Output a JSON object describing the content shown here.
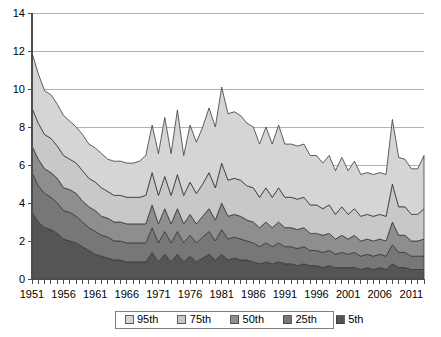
{
  "chart_data": {
    "type": "area",
    "stacked": true,
    "title": "",
    "xlabel": "",
    "ylabel": "",
    "ylim": [
      0,
      14
    ],
    "yticks": [
      0,
      2,
      4,
      6,
      8,
      10,
      12,
      14
    ],
    "grid": true,
    "legend_position": "bottom",
    "x_tick_labels": [
      "1951",
      "1956",
      "1961",
      "1966",
      "1971",
      "1976",
      "1981",
      "1986",
      "1991",
      "1996",
      "2001",
      "2006",
      "2011"
    ],
    "x": [
      1951,
      1952,
      1953,
      1954,
      1955,
      1956,
      1957,
      1958,
      1959,
      1960,
      1961,
      1962,
      1963,
      1964,
      1965,
      1966,
      1967,
      1968,
      1969,
      1970,
      1971,
      1972,
      1973,
      1974,
      1975,
      1976,
      1977,
      1978,
      1979,
      1980,
      1981,
      1982,
      1983,
      1984,
      1985,
      1986,
      1987,
      1988,
      1989,
      1990,
      1991,
      1992,
      1993,
      1994,
      1995,
      1996,
      1997,
      1998,
      1999,
      2000,
      2001,
      2002,
      2003,
      2004,
      2005,
      2006,
      2007,
      2008,
      2009,
      2010,
      2011,
      2012,
      2013
    ],
    "series": [
      {
        "name": "5th",
        "color": "#555555",
        "values": [
          3.5,
          3.0,
          2.7,
          2.6,
          2.4,
          2.1,
          2.0,
          1.9,
          1.7,
          1.5,
          1.3,
          1.2,
          1.1,
          1.0,
          1.0,
          0.9,
          0.9,
          0.9,
          0.9,
          1.4,
          0.9,
          1.3,
          0.9,
          1.3,
          0.9,
          1.2,
          0.9,
          1.1,
          1.3,
          1.0,
          1.3,
          1.0,
          1.1,
          1.0,
          1.0,
          0.9,
          0.8,
          0.9,
          0.8,
          0.9,
          0.8,
          0.8,
          0.7,
          0.8,
          0.7,
          0.7,
          0.6,
          0.7,
          0.6,
          0.6,
          0.6,
          0.6,
          0.5,
          0.6,
          0.5,
          0.6,
          0.5,
          0.8,
          0.6,
          0.6,
          0.5,
          0.5,
          0.5
        ]
      },
      {
        "name": "25th",
        "color": "#777777",
        "values": [
          2.1,
          1.9,
          1.8,
          1.7,
          1.6,
          1.5,
          1.5,
          1.4,
          1.3,
          1.2,
          1.2,
          1.1,
          1.1,
          1.0,
          1.0,
          1.0,
          1.0,
          1.0,
          1.0,
          1.3,
          1.0,
          1.2,
          1.0,
          1.2,
          1.0,
          1.1,
          1.0,
          1.1,
          1.2,
          1.0,
          1.3,
          1.1,
          1.1,
          1.1,
          1.0,
          1.0,
          0.9,
          1.0,
          0.9,
          1.0,
          0.9,
          0.9,
          0.9,
          0.9,
          0.8,
          0.8,
          0.8,
          0.8,
          0.7,
          0.8,
          0.7,
          0.8,
          0.7,
          0.7,
          0.7,
          0.7,
          0.7,
          1.0,
          0.8,
          0.8,
          0.7,
          0.7,
          0.7
        ]
      },
      {
        "name": "50th",
        "color": "#8e8e8e",
        "values": [
          1.4,
          1.4,
          1.3,
          1.3,
          1.3,
          1.2,
          1.2,
          1.2,
          1.1,
          1.1,
          1.1,
          1.0,
          1.0,
          1.0,
          1.0,
          1.0,
          1.0,
          1.0,
          1.0,
          1.2,
          1.0,
          1.2,
          1.0,
          1.2,
          1.0,
          1.1,
          1.0,
          1.1,
          1.2,
          1.1,
          1.4,
          1.2,
          1.2,
          1.2,
          1.1,
          1.1,
          1.0,
          1.1,
          1.0,
          1.1,
          1.0,
          1.0,
          1.0,
          1.0,
          0.9,
          0.9,
          0.9,
          0.9,
          0.8,
          0.9,
          0.8,
          0.9,
          0.8,
          0.8,
          0.8,
          0.8,
          0.8,
          1.2,
          0.9,
          0.9,
          0.8,
          0.8,
          0.9
        ]
      },
      {
        "name": "75th",
        "color": "#c8c8c8",
        "values": [
          2.0,
          1.9,
          1.8,
          1.8,
          1.7,
          1.7,
          1.6,
          1.6,
          1.6,
          1.5,
          1.5,
          1.5,
          1.4,
          1.4,
          1.4,
          1.4,
          1.4,
          1.4,
          1.5,
          1.7,
          1.5,
          1.7,
          1.5,
          1.8,
          1.5,
          1.7,
          1.6,
          1.7,
          1.9,
          1.7,
          2.1,
          1.9,
          1.9,
          1.9,
          1.8,
          1.8,
          1.6,
          1.8,
          1.6,
          1.8,
          1.6,
          1.6,
          1.6,
          1.6,
          1.5,
          1.5,
          1.4,
          1.5,
          1.3,
          1.5,
          1.3,
          1.4,
          1.3,
          1.3,
          1.3,
          1.3,
          1.3,
          2.0,
          1.5,
          1.5,
          1.4,
          1.4,
          1.6
        ]
      },
      {
        "name": "95th",
        "color": "#d5d5d5",
        "values": [
          2.9,
          2.6,
          2.3,
          2.3,
          2.2,
          2.1,
          2.0,
          1.9,
          1.9,
          1.8,
          1.8,
          1.8,
          1.7,
          1.8,
          1.8,
          1.8,
          1.8,
          1.9,
          2.1,
          2.5,
          2.2,
          3.1,
          2.2,
          3.4,
          2.1,
          3.0,
          2.7,
          3.0,
          3.4,
          3.2,
          4.0,
          3.5,
          3.5,
          3.4,
          3.3,
          3.2,
          2.8,
          3.2,
          2.8,
          3.3,
          2.8,
          2.8,
          2.8,
          2.8,
          2.6,
          2.6,
          2.4,
          2.6,
          2.3,
          2.6,
          2.3,
          2.5,
          2.2,
          2.2,
          2.2,
          2.2,
          2.2,
          3.4,
          2.6,
          2.5,
          2.4,
          2.4,
          2.8
        ]
      }
    ],
    "series_totals_note": "values are incremental band heights; stacked totals peak ~12.2 in 1981 and ~11.9 in 1951"
  },
  "legend": {
    "items": [
      {
        "label": "95th",
        "color": "#d5d5d5"
      },
      {
        "label": "75th",
        "color": "#c8c8c8"
      },
      {
        "label": "50th",
        "color": "#8e8e8e"
      },
      {
        "label": "25th",
        "color": "#777777"
      },
      {
        "label": "5th",
        "color": "#555555"
      }
    ]
  }
}
